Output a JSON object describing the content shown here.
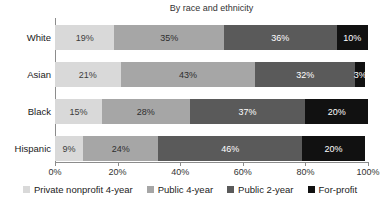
{
  "chart_data": {
    "type": "bar",
    "subtype": "horizontal-stacked",
    "title": "By race and ethnicity",
    "categories": [
      "White",
      "Asian",
      "Black",
      "Hispanic"
    ],
    "series": [
      {
        "name": "Private nonprofit 4-year",
        "color": "#d9d9d9",
        "label_color": "#3d3d3d",
        "values": [
          19,
          21,
          15,
          9
        ]
      },
      {
        "name": "Public 4-year",
        "color": "#a6a6a6",
        "label_color": "#2e2e2e",
        "values": [
          35,
          43,
          28,
          24
        ]
      },
      {
        "name": "Public 2-year",
        "color": "#5a5a5a",
        "label_color": "#ffffff",
        "values": [
          36,
          32,
          37,
          46
        ]
      },
      {
        "name": "For-profit",
        "color": "#111111",
        "label_color": "#ffffff",
        "values": [
          10,
          3,
          20,
          20
        ]
      }
    ],
    "value_suffix": "%",
    "xlabel": "",
    "ylabel": "",
    "xlim": [
      0,
      100
    ],
    "x_ticks": [
      "0%",
      "20%",
      "40%",
      "60%",
      "80%",
      "100%"
    ],
    "grid": "off",
    "legend_position": "bottom"
  }
}
